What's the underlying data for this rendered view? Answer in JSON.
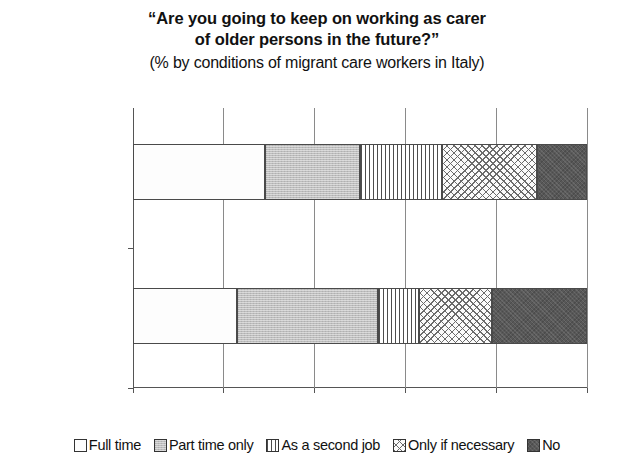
{
  "title": {
    "line1": "“Are you going to keep on working as carer",
    "line2": "of older persons in the future?”",
    "subtitle": "(% by conditions of migrant care workers in Italy)"
  },
  "colors": {
    "full_time": "#ffffff",
    "part_time_only": "#bdbdbd",
    "as_a_second_job": "#fafafa",
    "only_if_necessary": "#fbfbfb",
    "no": "#585858",
    "axis": "#555555",
    "gridline": "#8a8a8a",
    "text": "#111111"
  },
  "chart_data": {
    "type": "bar",
    "orientation": "horizontal",
    "stacked": true,
    "stack_mode": "percent",
    "title": "“Are you going to keep on working as carer of older persons in the future?”",
    "subtitle": "(% by conditions of migrant care workers in Italy)",
    "xlabel": "",
    "ylabel": "",
    "xlim": [
      0,
      100
    ],
    "xticks": [
      0,
      20,
      40,
      60,
      80,
      100
    ],
    "xticklabels": [
      "0%",
      "20%",
      "40%",
      "60%",
      "80%",
      "100%"
    ],
    "categories": [
      "Without contract",
      "Regularly employed"
    ],
    "grid": true,
    "grid_axis": "x",
    "legend_position": "bottom",
    "series": [
      {
        "name": "Full time",
        "pattern": "solid-white",
        "values": [
          29,
          23
        ]
      },
      {
        "name": "Part time only",
        "pattern": "solid-gray",
        "values": [
          21,
          31
        ]
      },
      {
        "name": "As a second job",
        "pattern": "vertical-lines",
        "values": [
          18,
          9
        ]
      },
      {
        "name": "Only if necessary",
        "pattern": "crosshatch",
        "values": [
          21,
          16
        ]
      },
      {
        "name": "No",
        "pattern": "solid-dark",
        "values": [
          11,
          21
        ]
      }
    ]
  },
  "legend": {
    "items": [
      {
        "label": "Full time"
      },
      {
        "label": "Part time only"
      },
      {
        "label": "As a second job"
      },
      {
        "label": "Only if necessary"
      },
      {
        "label": "No"
      }
    ]
  }
}
